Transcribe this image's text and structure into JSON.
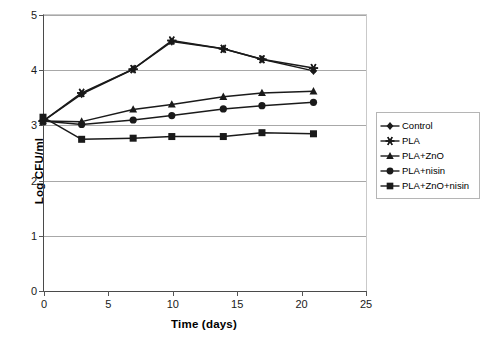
{
  "chart_data": {
    "type": "line",
    "title": "",
    "xlabel": "Time (days)",
    "ylabel": "Log CFU/ml",
    "xlim": [
      0,
      25
    ],
    "ylim": [
      0,
      5
    ],
    "xticks": [
      0,
      5,
      10,
      15,
      20,
      25
    ],
    "yticks": [
      0,
      1,
      2,
      3,
      4,
      5
    ],
    "xtick_labels": [
      "0",
      "5",
      "10",
      "15",
      "20",
      "25"
    ],
    "ytick_labels": [
      "0",
      "1",
      "2",
      "3",
      "4",
      "5"
    ],
    "grid": "horizontal",
    "legend_position": "right",
    "x": [
      0,
      3,
      7,
      10,
      14,
      17,
      21
    ],
    "series": [
      {
        "name": "Control",
        "marker": "diamond",
        "color": "#1a1a1a",
        "values": [
          3.06,
          3.55,
          4.0,
          4.5,
          4.37,
          4.18,
          3.97
        ]
      },
      {
        "name": "PLA",
        "marker": "asterisk",
        "color": "#1a1a1a",
        "values": [
          3.06,
          3.57,
          4.0,
          4.52,
          4.37,
          4.18,
          4.02
        ]
      },
      {
        "name": "PLA+ZnO",
        "marker": "triangle",
        "color": "#1a1a1a",
        "values": [
          3.06,
          3.05,
          3.27,
          3.36,
          3.5,
          3.57,
          3.6
        ]
      },
      {
        "name": "PLA+nisin",
        "marker": "circle",
        "color": "#1a1a1a",
        "values": [
          3.06,
          3.0,
          3.08,
          3.16,
          3.28,
          3.34,
          3.4
        ]
      },
      {
        "name": "PLA+ZnO+nisin",
        "marker": "square",
        "color": "#1a1a1a",
        "values": [
          3.13,
          2.73,
          2.75,
          2.78,
          2.78,
          2.85,
          2.83
        ]
      }
    ]
  },
  "legend": {
    "items": [
      {
        "label": "Control",
        "marker": "diamond"
      },
      {
        "label": "PLA",
        "marker": "asterisk"
      },
      {
        "label": "PLA+ZnO",
        "marker": "triangle"
      },
      {
        "label": "PLA+nisin",
        "marker": "circle"
      },
      {
        "label": "PLA+ZnO+nisin",
        "marker": "square"
      }
    ]
  },
  "style": {
    "line_color": "#1a1a1a",
    "grid_color": "#a8a8a8",
    "axis_color": "#4a4a4a",
    "background": "#ffffff"
  }
}
